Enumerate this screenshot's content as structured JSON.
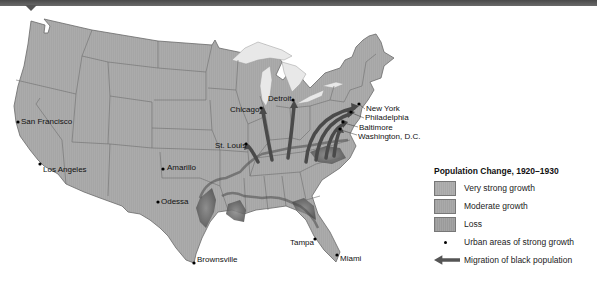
{
  "map": {
    "title": "Population Change, 1920–1930",
    "region": "United States",
    "colors": {
      "very_strong_growth": "#a4a4a4",
      "moderate_growth": "#a9a9a9",
      "loss": "#9a9a9a",
      "loss_shading": "#555555",
      "migration_arrow": "#4a4a4a",
      "water": "#e6e6e6"
    }
  },
  "cities": [
    {
      "name": "San Francisco",
      "x": 18,
      "y": 122
    },
    {
      "name": "Los Angeles",
      "x": 40,
      "y": 164
    },
    {
      "name": "Chicago",
      "x": 261,
      "y": 108
    },
    {
      "name": "Detroit",
      "x": 293,
      "y": 100
    },
    {
      "name": "St. Louis",
      "x": 246,
      "y": 144
    },
    {
      "name": "Amarillo",
      "x": 163,
      "y": 169
    },
    {
      "name": "Odessa",
      "x": 158,
      "y": 202
    },
    {
      "name": "Brownsville",
      "x": 194,
      "y": 263
    },
    {
      "name": "Tampa",
      "x": 315,
      "y": 239
    },
    {
      "name": "Miami",
      "x": 337,
      "y": 255
    },
    {
      "name": "New York",
      "x": 359,
      "y": 104
    },
    {
      "name": "Philadelphia",
      "x": 351,
      "y": 112
    },
    {
      "name": "Baltimore",
      "x": 343,
      "y": 122
    },
    {
      "name": "Washington, D.C.",
      "x": 340,
      "y": 129
    }
  ],
  "legend": {
    "title": "Population Change, 1920–1930",
    "items": [
      {
        "type": "swatch",
        "label": "Very strong growth"
      },
      {
        "type": "swatch",
        "label": "Moderate growth"
      },
      {
        "type": "swatch",
        "label": "Loss"
      },
      {
        "type": "dot",
        "label": "Urban areas of strong growth"
      },
      {
        "type": "arrow",
        "label": "Migration of black population"
      }
    ]
  }
}
